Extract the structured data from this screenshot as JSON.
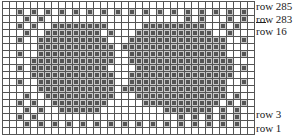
{
  "chart": {
    "cols": 36,
    "rows_count": 19,
    "rows": [
      "....................................",
      "..#.#.#.#.#.#.#.#.#.#.#.#.#.#.#.#.#.",
      "...#.#....................#.#...#.#.",
      "..#.#..########.....#########..#.#..",
      "...#..########.#...###########..#...",
      "..#..##########...##############..#.",
      ".....###########.###############....",
      "..#..###########..##############..#.",
      "....############..###############...",
      "..#.###########....##############.#.",
      "....############..###############...",
      "..#..###########..##############..#.",
      ".....###########.###############....",
      "...#..##########...#############.#..",
      "..#.#..########.....###########.#.#.",
      "...#.#..######.........#######.#.#..",
      "..#.#....................#.#.#.#.#..",
      "...#.#.#.#.#.#.#.#.#.#.#.#.#.#.#.#..",
      "...................................."
    ]
  },
  "labels": [
    {
      "text": "row 285",
      "top": 1
    },
    {
      "text": "row 283",
      "top": 14
    },
    {
      "text": "row 16",
      "top": 26
    },
    {
      "text": "row 3",
      "top": 109
    },
    {
      "text": "row 1",
      "top": 123
    }
  ]
}
